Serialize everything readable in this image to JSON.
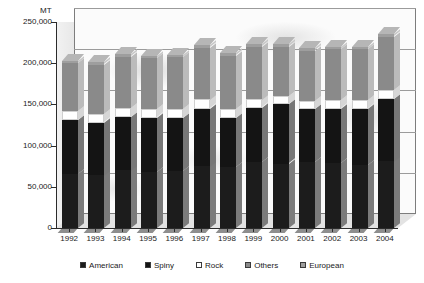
{
  "chart_data": {
    "type": "bar",
    "subtype": "stacked-column-3d",
    "title": "",
    "xlabel": "",
    "ylabel": "MT",
    "unit_label": "MT",
    "ylim": [
      0,
      250000
    ],
    "ytick_values": [
      0,
      50000,
      100000,
      150000,
      200000,
      250000
    ],
    "ytick_labels": [
      "0",
      "50,000",
      "100,000",
      "150,000",
      "200,000",
      "250,000"
    ],
    "grid": true,
    "legend_position": "bottom",
    "categories": [
      "1992",
      "1993",
      "1994",
      "1995",
      "1996",
      "1997",
      "1998",
      "1999",
      "2000",
      "2001",
      "2002",
      "2003",
      "2004"
    ],
    "series": [
      {
        "name": "American",
        "color": "#1c1c1c",
        "values": [
          66000,
          64000,
          70000,
          68000,
          69000,
          75000,
          74000,
          80000,
          78000,
          80000,
          79000,
          77000,
          81000
        ]
      },
      {
        "name": "Spiny",
        "color": "#141414",
        "values": [
          65000,
          64000,
          65000,
          66000,
          64000,
          70000,
          60000,
          66000,
          72000,
          64000,
          66000,
          68000,
          76000
        ]
      },
      {
        "name": "Rock",
        "color": "#ffffff",
        "values": [
          11000,
          10000,
          11000,
          10000,
          11000,
          11000,
          11000,
          10000,
          10000,
          10000,
          10000,
          10000,
          11000
        ]
      },
      {
        "name": "Others",
        "color": "#8a8a8a",
        "values": [
          58000,
          60000,
          62000,
          62000,
          63000,
          63000,
          64000,
          64000,
          60000,
          61000,
          62000,
          62000,
          64000
        ]
      },
      {
        "name": "European",
        "color": "#9e9e9e",
        "values": [
          3000,
          3000,
          3000,
          3000,
          3000,
          3000,
          3000,
          3000,
          3000,
          3000,
          3000,
          3000,
          3000
        ]
      }
    ],
    "totals": [
      203000,
      201000,
      211000,
      209000,
      210000,
      222000,
      212000,
      223000,
      223000,
      218000,
      220000,
      220000,
      236000
    ]
  },
  "legend": {
    "items": [
      {
        "label": "American",
        "color": "#1c1c1c"
      },
      {
        "label": "Spiny",
        "color": "#141414"
      },
      {
        "label": "Rock",
        "color": "#ffffff"
      },
      {
        "label": "Others",
        "color": "#8a8a8a"
      },
      {
        "label": "European",
        "color": "#9e9e9e"
      }
    ]
  }
}
